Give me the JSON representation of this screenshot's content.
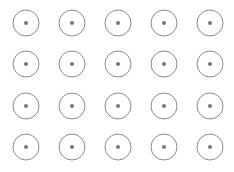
{
  "grid": {
    "rows": 4,
    "cols": 5,
    "col_centers": [
      26,
      72,
      118,
      164,
      210
    ],
    "row_centers": [
      23,
      64,
      106,
      147
    ],
    "ring_radius": 13,
    "dot_radius": 2,
    "ring_color": "#8a8a8a",
    "dot_color": "#777777",
    "background": "#ffffff"
  }
}
